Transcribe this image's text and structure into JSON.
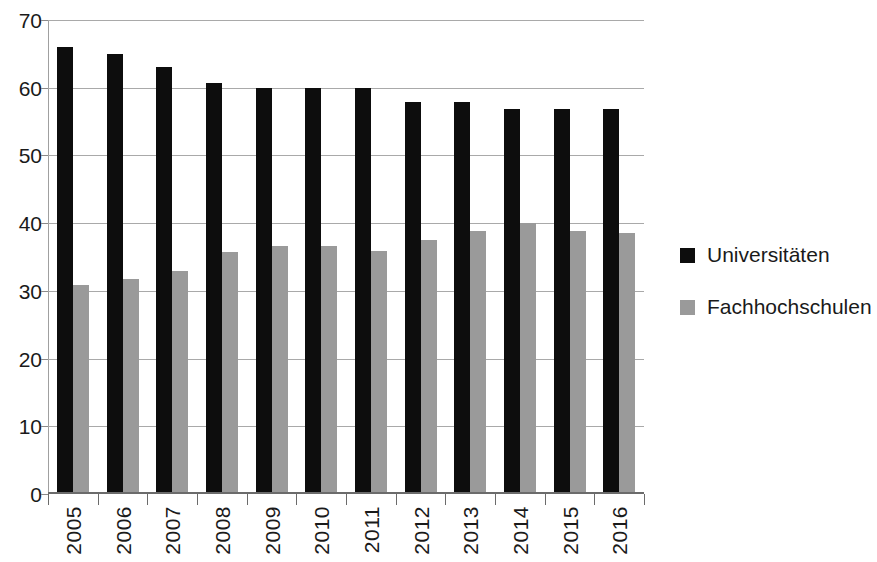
{
  "chart_data": {
    "type": "bar",
    "title": "",
    "xlabel": "",
    "ylabel": "",
    "categories": [
      "2005",
      "2006",
      "2007",
      "2008",
      "2009",
      "2010",
      "2011",
      "2012",
      "2013",
      "2014",
      "2015",
      "2016"
    ],
    "series": [
      {
        "name": "Universitäten",
        "color": "#0d0d0d",
        "values": [
          66,
          65,
          63,
          60.7,
          60,
          60,
          60,
          57.9,
          57.9,
          56.9,
          56.9,
          56.9
        ]
      },
      {
        "name": "Fachhochschulen",
        "color": "#9a9a9a",
        "values": [
          30.9,
          31.7,
          33,
          35.8,
          36.7,
          36.7,
          35.9,
          37.5,
          38.8,
          40,
          38.8,
          38.6
        ]
      }
    ],
    "ylim": [
      0,
      70
    ],
    "yticks": [
      0,
      10,
      20,
      30,
      40,
      50,
      60,
      70
    ],
    "ytick_labels": [
      "0",
      "10",
      "20",
      "30",
      "40",
      "50",
      "60",
      "70"
    ],
    "grid": true,
    "grid_axis": "y",
    "legend_position": "right"
  },
  "legend": {
    "items": [
      {
        "label": "Universitäten"
      },
      {
        "label": "Fachhochschulen"
      }
    ]
  }
}
